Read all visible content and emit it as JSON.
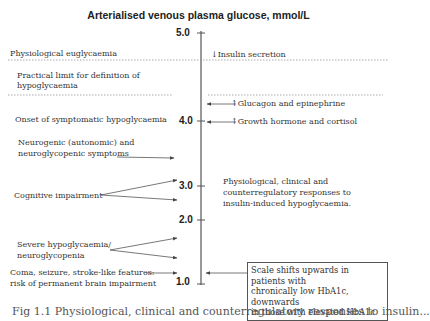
{
  "title": "Arterialised venous plasma glucose, mmol/L",
  "axis": {
    "ticks": [
      {
        "label": "5.0",
        "y": 33
      },
      {
        "label": "4.0",
        "y": 121
      },
      {
        "label": "3.0",
        "y": 186
      },
      {
        "label": "2.0",
        "y": 220
      },
      {
        "label": "1.0",
        "y": 281
      }
    ]
  },
  "left_labels": {
    "euglycaemia": "Physiological euglycaemia",
    "practical_limit_1": "Practical limit for definition of",
    "practical_limit_2": "hypoglycaemia",
    "onset": "Onset of symptomatic hypoglycaemia",
    "neurogenic_1": "Neurogenic (autonomic) and",
    "neurogenic_2": "neuroglycopenic symptoms",
    "cognitive": "Cognitive impairment",
    "severe_1": "Severe hypoglycaemia/",
    "severe_2": "neuroglycopenia",
    "coma_1": "Coma, seizure, stroke-like features:",
    "coma_2": "risk of permanent brain impairment"
  },
  "right_labels": {
    "insulin": "↓Insulin secretion",
    "glucagon": "↑Glucagon and epinephrine",
    "growth": "↑Growth hormone and cortisol",
    "responses_1": "Physiological, clinical and",
    "responses_2": "counterregulatory responses to",
    "responses_3": "insulin-induced hypoglycaemia."
  },
  "note_box": {
    "line1": "Scale shifts upwards in patients with",
    "line2": "chronically low HbA1c, downwards",
    "line3": "in those with elevated HbA1c"
  },
  "caption_partial": "Fig 1.1  Physiological, clinical and counterregulatory responses to insulin..."
}
